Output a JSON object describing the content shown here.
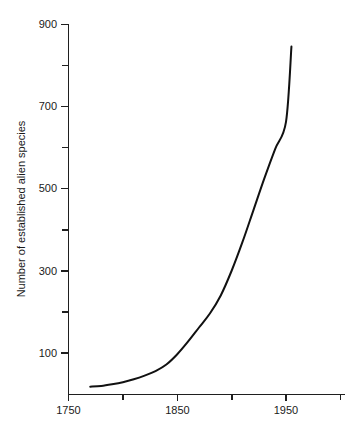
{
  "chart_data": {
    "type": "line",
    "title": "",
    "subtitle": "",
    "xlabel": "",
    "ylabel": "Number of established alien species",
    "xlim": [
      1750,
      2000
    ],
    "ylim": [
      0,
      900
    ],
    "grid": false,
    "legend": null,
    "legend_position": "none",
    "x_major_ticks": [
      1750,
      1850,
      1950
    ],
    "x_major_tick_labels": [
      "1750",
      "1850",
      "1950"
    ],
    "x_minor_ticks": [
      1800,
      1900,
      2000
    ],
    "y_major_ticks": [
      100,
      300,
      500,
      700,
      900
    ],
    "y_major_tick_labels": [
      "100",
      "300",
      "500",
      "700",
      "900"
    ],
    "y_minor_ticks": [
      200,
      400,
      600,
      800
    ],
    "series": [
      {
        "name": "Established alien species",
        "color": "#111111",
        "x": [
          1770,
          1780,
          1790,
          1800,
          1810,
          1820,
          1830,
          1840,
          1850,
          1860,
          1870,
          1880,
          1890,
          1900,
          1910,
          1920,
          1930,
          1940,
          1950,
          1955
        ],
        "values": [
          18,
          20,
          24,
          29,
          36,
          45,
          56,
          72,
          97,
          128,
          162,
          196,
          240,
          300,
          370,
          447,
          524,
          596,
          662,
          845
        ]
      }
    ],
    "annotations": []
  },
  "axis": {
    "y_title": "Number of established alien species"
  }
}
